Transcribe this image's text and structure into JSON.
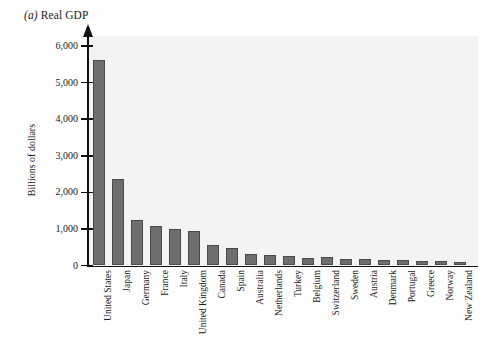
{
  "figure": {
    "panel_prefix": "(a)",
    "panel_title": "Real GDP"
  },
  "chart_data": {
    "type": "bar",
    "title": "(a) Real GDP",
    "xlabel": "",
    "ylabel": "Billions of dollars",
    "ylim": [
      0,
      6000
    ],
    "ytick_labels": [
      "0",
      "1,000",
      "2,000",
      "3,000",
      "4,000",
      "5,000",
      "6,000"
    ],
    "ytick_values": [
      0,
      1000,
      2000,
      3000,
      4000,
      5000,
      6000
    ],
    "grid": false,
    "legend": "none",
    "categories": [
      "United States",
      "Japan",
      "Germany",
      "France",
      "Italy",
      "United Kingdom",
      "Canada",
      "Spain",
      "Australia",
      "Netherlands",
      "Turkey",
      "Belgium",
      "Switzerland",
      "Sweden",
      "Austria",
      "Denmark",
      "Portugal",
      "Greece",
      "Norway",
      "New Zealand"
    ],
    "values": [
      5610,
      2370,
      1250,
      1070,
      1010,
      950,
      570,
      490,
      310,
      280,
      250,
      200,
      230,
      180,
      170,
      150,
      140,
      125,
      115,
      105
    ],
    "bar_color": "#6e6e6e",
    "plot_background": "#f3f3f3"
  }
}
